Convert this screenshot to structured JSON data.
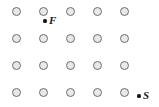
{
  "figure": {
    "kind": "point-lattice-diagram",
    "background_color": "#ffffff",
    "width": 159,
    "height": 107,
    "lattice": {
      "name": "circle-grid",
      "rows": 4,
      "cols": 5,
      "node_shape": "open-circle",
      "node_diameter": 9,
      "node_fill": "#e8e8e8",
      "node_stroke": "#6e6e6e",
      "col_x": [
        16,
        43,
        70,
        97,
        124
      ],
      "row_y": [
        11,
        38,
        65,
        92
      ],
      "nodes": [
        {
          "row": 1,
          "col": 1,
          "x": 16,
          "y": 11
        },
        {
          "row": 1,
          "col": 2,
          "x": 43,
          "y": 11
        },
        {
          "row": 1,
          "col": 3,
          "x": 70,
          "y": 11
        },
        {
          "row": 1,
          "col": 4,
          "x": 97,
          "y": 11
        },
        {
          "row": 1,
          "col": 5,
          "x": 124,
          "y": 11
        },
        {
          "row": 2,
          "col": 1,
          "x": 16,
          "y": 38
        },
        {
          "row": 2,
          "col": 2,
          "x": 43,
          "y": 38
        },
        {
          "row": 2,
          "col": 3,
          "x": 70,
          "y": 38
        },
        {
          "row": 2,
          "col": 4,
          "x": 97,
          "y": 38
        },
        {
          "row": 2,
          "col": 5,
          "x": 124,
          "y": 38
        },
        {
          "row": 3,
          "col": 1,
          "x": 16,
          "y": 65
        },
        {
          "row": 3,
          "col": 2,
          "x": 43,
          "y": 65
        },
        {
          "row": 3,
          "col": 3,
          "x": 70,
          "y": 65
        },
        {
          "row": 3,
          "col": 4,
          "x": 97,
          "y": 65
        },
        {
          "row": 3,
          "col": 5,
          "x": 124,
          "y": 65
        },
        {
          "row": 4,
          "col": 1,
          "x": 16,
          "y": 92
        },
        {
          "row": 4,
          "col": 2,
          "x": 43,
          "y": 92
        },
        {
          "row": 4,
          "col": 3,
          "x": 70,
          "y": 92
        },
        {
          "row": 4,
          "col": 4,
          "x": 97,
          "y": 92
        },
        {
          "row": 4,
          "col": 5,
          "x": 124,
          "y": 92
        }
      ]
    },
    "marked_points": [
      {
        "id": "point-f",
        "label": "F",
        "dot_x": 45,
        "dot_y": 21,
        "label_x": 49,
        "label_y": 15,
        "dot_color": "#1a1a1a",
        "label_color": "#1a1a1a"
      },
      {
        "id": "point-s",
        "label": "S",
        "dot_x": 139,
        "dot_y": 96,
        "label_x": 143,
        "label_y": 90,
        "dot_color": "#1a1a1a",
        "label_color": "#1a1a1a"
      }
    ]
  }
}
